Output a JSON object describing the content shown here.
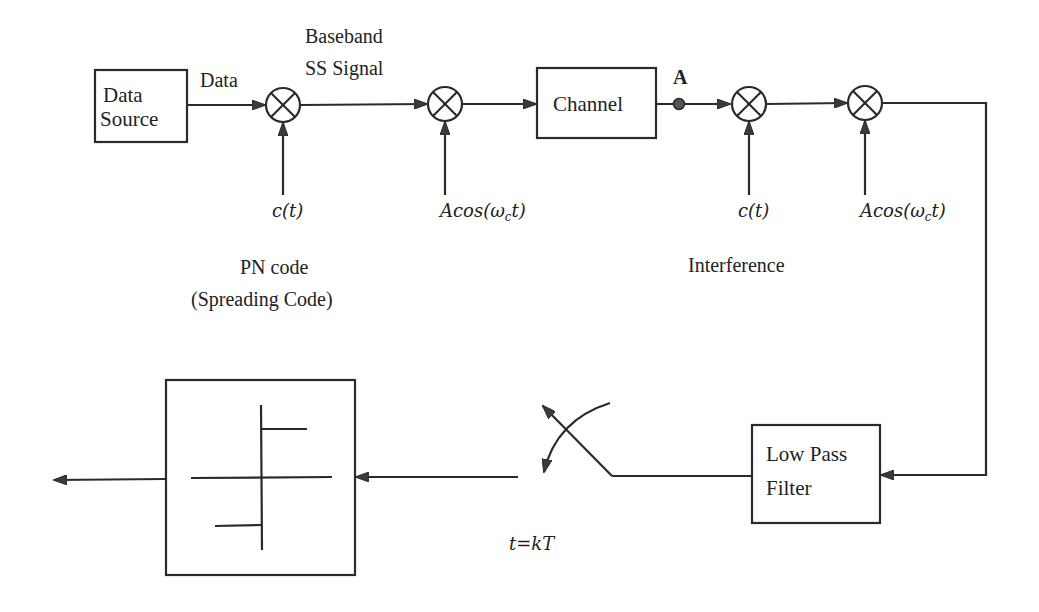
{
  "diagram": {
    "blocks": {
      "data_source": {
        "line1": "Data",
        "line2": "Source"
      },
      "channel": {
        "label": "Channel"
      },
      "low_pass_filter": {
        "line1": "Low Pass",
        "line2": "Filter"
      },
      "decision_device": {
        "label": ""
      }
    },
    "signals": {
      "data": "Data",
      "baseband_line1": "Baseband",
      "baseband_line2": "SS Signal",
      "point_a": "A"
    },
    "multiplier_inputs": {
      "m1": "c(t)",
      "m2": "Acos(ωct)",
      "m3": "c(t)",
      "m4": "Acos(ωct)"
    },
    "math_parts": {
      "acos_prefix": "Acos(ω",
      "acos_sub": "c",
      "acos_suffix": "t)"
    },
    "annotations": {
      "pn_code_line1": "PN code",
      "pn_code_line2": "(Spreading Code)",
      "interference": "Interference",
      "sampling": "t=kT"
    },
    "multipliers": [
      {
        "id": "m1",
        "cx": 283,
        "cy": 105
      },
      {
        "id": "m2",
        "cx": 445,
        "cy": 104
      },
      {
        "id": "m3",
        "cx": 749,
        "cy": 104
      },
      {
        "id": "m4",
        "cx": 865,
        "cy": 103
      }
    ]
  }
}
